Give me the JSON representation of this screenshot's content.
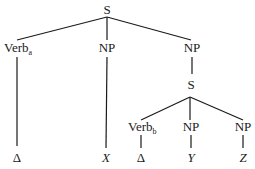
{
  "diagram": {
    "type": "syntax-tree",
    "nodes": {
      "root": {
        "label": "S"
      },
      "verb_a": {
        "label": "Verb",
        "subscript": "a"
      },
      "np1": {
        "label": "NP"
      },
      "np2": {
        "label": "NP"
      },
      "s_embedded": {
        "label": "S"
      },
      "verb_b": {
        "label": "Verb",
        "subscript": "b"
      },
      "np3": {
        "label": "NP"
      },
      "np4": {
        "label": "NP"
      },
      "leaf_delta1": {
        "label": "Δ"
      },
      "leaf_x": {
        "label": "X"
      },
      "leaf_delta2": {
        "label": "Δ"
      },
      "leaf_y": {
        "label": "Y"
      },
      "leaf_z": {
        "label": "Z"
      }
    },
    "edges": [
      [
        "root",
        "verb_a"
      ],
      [
        "root",
        "np1"
      ],
      [
        "root",
        "np2"
      ],
      [
        "verb_a",
        "leaf_delta1"
      ],
      [
        "np1",
        "leaf_x"
      ],
      [
        "np2",
        "s_embedded"
      ],
      [
        "s_embedded",
        "verb_b"
      ],
      [
        "s_embedded",
        "np3"
      ],
      [
        "s_embedded",
        "np4"
      ],
      [
        "verb_b",
        "leaf_delta2"
      ],
      [
        "np3",
        "leaf_y"
      ],
      [
        "np4",
        "leaf_z"
      ]
    ]
  }
}
